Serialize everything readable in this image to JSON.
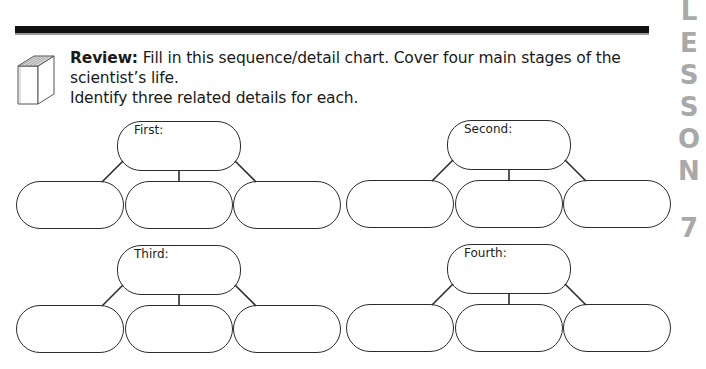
{
  "header": {
    "rule": "thick-black-rule",
    "icon": "book-icon"
  },
  "instructions": {
    "lead": "Review:",
    "line1": " Fill in this sequence/detail chart. Cover four main stages of the scientist’s life.",
    "line2": "Identify three related details for each."
  },
  "lesson_tab": {
    "letters": [
      "L",
      "E",
      "S",
      "S",
      "O",
      "N"
    ],
    "number": "7",
    "color": "#a9a9a9"
  },
  "diagrams": [
    {
      "label": "First:",
      "details": [
        "",
        "",
        ""
      ]
    },
    {
      "label": "Second:",
      "details": [
        "",
        "",
        ""
      ]
    },
    {
      "label": "Third:",
      "details": [
        "",
        "",
        ""
      ]
    },
    {
      "label": "Fourth:",
      "details": [
        "",
        "",
        ""
      ]
    }
  ]
}
